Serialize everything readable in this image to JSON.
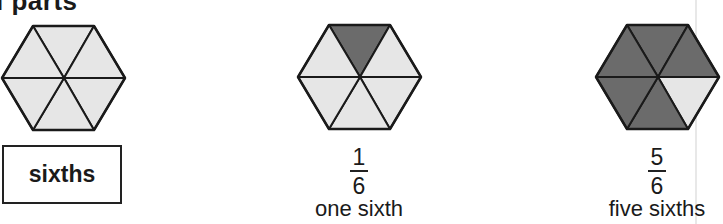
{
  "heading": "l parts",
  "colors": {
    "light_fill": "#e6e6e6",
    "dark_fill": "#6b6b6b",
    "stroke": "#1a1a1a"
  },
  "figures": [
    {
      "shaded_parts": 0,
      "total_parts": 6,
      "label": "sixths"
    },
    {
      "shaded_parts": 1,
      "total_parts": 6,
      "numerator": "1",
      "denominator": "6",
      "words": "one sixth"
    },
    {
      "shaded_parts": 5,
      "total_parts": 6,
      "numerator": "5",
      "denominator": "6",
      "words": "five sixths"
    }
  ]
}
